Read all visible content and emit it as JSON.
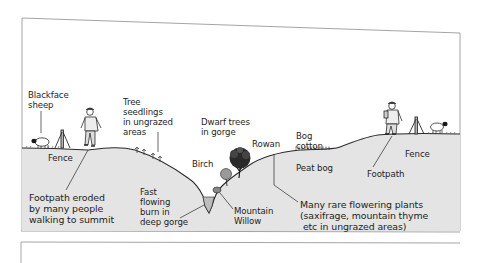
{
  "diagram": {
    "colors": {
      "ground_fill": "#e4e4e4",
      "line": "#2a2a2a",
      "frame": "#9a9a9a",
      "water": "#bdbdbd",
      "tree": "#1a1a1a"
    },
    "labels": {
      "blackface_sheep": "Blackface\nsheep",
      "fence_left": "Fence",
      "footpath_eroded": "Footpath eroded\nby many people\nwalking to summit",
      "tree_seedlings": "Tree\nseedlings\nin ungrazed\nareas",
      "fast_burn": "Fast\nflowing\nburn in\ndeep gorge",
      "dwarf_trees": "Dwarf trees\nin gorge",
      "birch": "Birch",
      "rowan": "Rowan",
      "mountain_willow": "Mountain\nWillow",
      "bog_cotton": "Bog\ncotton",
      "peat_bog": "Peat bog",
      "rare_plants": "Many rare flowering plants\n(saxifrage, mountain thyme\n etc in ungrazed areas)",
      "fence_right": "Fence",
      "footpath_right": "Footpath"
    },
    "elements": [
      {
        "name": "sheep",
        "side": "left"
      },
      {
        "name": "fence-post",
        "side": "left"
      },
      {
        "name": "walker",
        "side": "left"
      },
      {
        "name": "tree-seedlings",
        "side": "left-slope"
      },
      {
        "name": "gorge-burn",
        "side": "center"
      },
      {
        "name": "birch-tree",
        "side": "gorge"
      },
      {
        "name": "rowan-tree",
        "side": "gorge"
      },
      {
        "name": "mountain-willow",
        "side": "gorge"
      },
      {
        "name": "bog-cotton",
        "side": "plateau"
      },
      {
        "name": "walker",
        "side": "right"
      },
      {
        "name": "fence-post",
        "side": "right"
      },
      {
        "name": "sheep",
        "side": "right"
      }
    ]
  }
}
